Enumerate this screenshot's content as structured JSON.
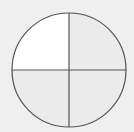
{
  "diagram": {
    "type": "fraction-circle",
    "parts": 4,
    "shaded_parts": 3,
    "unshaded_parts": 1,
    "circle": {
      "cx": 69,
      "cy": 70,
      "r": 57
    },
    "colors": {
      "background": "#efefef",
      "shaded": "#ebebeb",
      "unshaded": "#ffffff",
      "stroke": "#555555"
    },
    "quadrants": [
      {
        "name": "top-left",
        "shaded": false
      },
      {
        "name": "top-right",
        "shaded": true
      },
      {
        "name": "bottom-left",
        "shaded": true
      },
      {
        "name": "bottom-right",
        "shaded": true
      }
    ]
  }
}
